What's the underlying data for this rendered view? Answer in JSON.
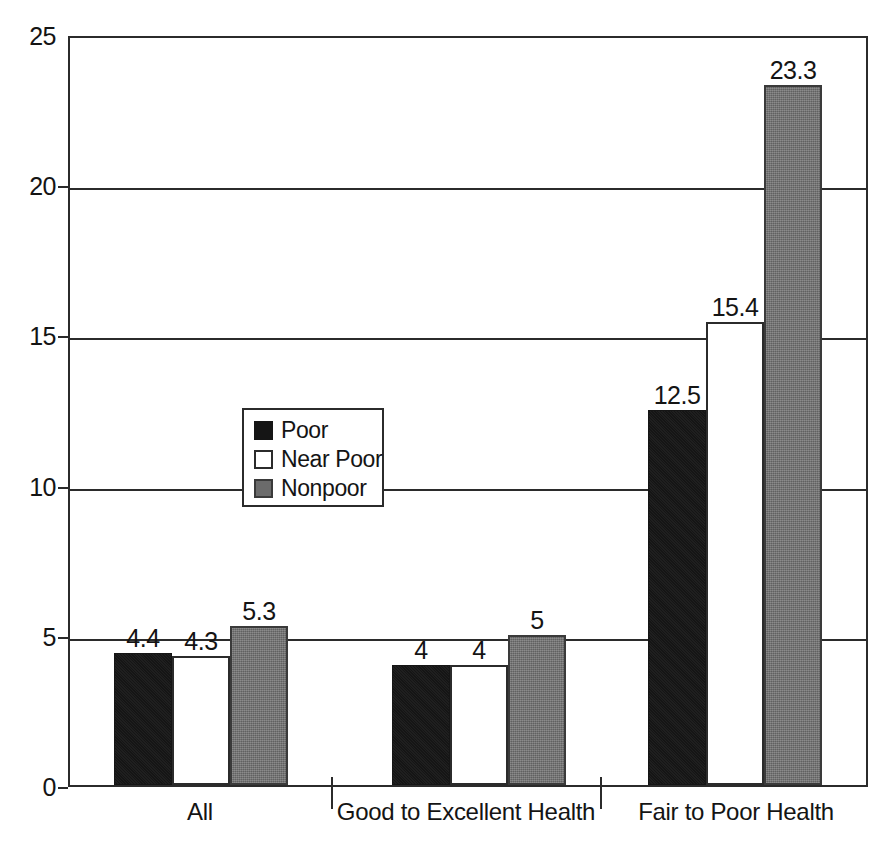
{
  "chart_data": {
    "type": "bar",
    "title": "",
    "subtitle": "",
    "xlabel": "",
    "ylabel": "",
    "ylim": [
      0,
      25
    ],
    "ytick_values": [
      0,
      5,
      10,
      15,
      20,
      25
    ],
    "ytick_labels": [
      "0",
      "5",
      "10",
      "15",
      "20",
      "25"
    ],
    "grid": true,
    "legend_position": "inside-upper-left",
    "categories": [
      "All",
      "Good to Excellent Health",
      "Fair to Poor Health"
    ],
    "series": [
      {
        "name": "Poor",
        "color": "#151515",
        "values": [
          4.4,
          4.3,
          12.5
        ]
      },
      {
        "name": "Near Poor",
        "color": "#ffffff",
        "values": [
          4.3,
          4,
          15.4
        ]
      },
      {
        "name": "Nonpoor",
        "color": "#6b6b6b",
        "values": [
          5.3,
          5,
          23.3
        ]
      }
    ],
    "groups": [
      {
        "category": "All",
        "bars": [
          {
            "series": "Poor",
            "value": 4.4,
            "label": "4.4"
          },
          {
            "series": "Near Poor",
            "value": 4.3,
            "label": "4.3"
          },
          {
            "series": "Nonpoor",
            "value": 5.3,
            "label": "5.3"
          }
        ]
      },
      {
        "category": "Good to Excellent Health",
        "bars": [
          {
            "series": "Poor",
            "value": 4,
            "label": "4"
          },
          {
            "series": "Near Poor",
            "value": 4,
            "label": "4"
          },
          {
            "series": "Nonpoor",
            "value": 5,
            "label": "5"
          }
        ]
      },
      {
        "category": "Fair to Poor Health",
        "bars": [
          {
            "series": "Poor",
            "value": 12.5,
            "label": "12.5"
          },
          {
            "series": "Near Poor",
            "value": 15.4,
            "label": "15.4"
          },
          {
            "series": "Nonpoor",
            "value": 23.3,
            "label": "23.3"
          }
        ]
      }
    ]
  },
  "legend": {
    "items": [
      {
        "label": "Poor",
        "swatch": "black-square-swatch"
      },
      {
        "label": "Near Poor",
        "swatch": "white-square-swatch"
      },
      {
        "label": "Nonpoor",
        "swatch": "gray-square-swatch"
      }
    ]
  },
  "colors": {
    "poor": "#151515",
    "near_poor": "#ffffff",
    "nonpoor": "#6b6b6b",
    "axis": "#2b2b2b",
    "text": "#141414",
    "background": "#ffffff"
  },
  "axis": {
    "y_ticks": [
      "0",
      "5",
      "10",
      "15",
      "20",
      "25"
    ],
    "x_categories": [
      "All",
      "Good to Excellent Health",
      "Fair to Poor Health"
    ]
  }
}
